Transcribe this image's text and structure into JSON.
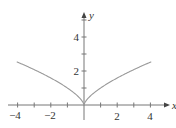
{
  "chart_data": {
    "type": "line",
    "title": "",
    "xlabel": "x",
    "ylabel": "y",
    "function": "y = |x|^(2/3)",
    "xlim": [
      -4.2,
      4.2
    ],
    "ylim": [
      0,
      5.5
    ],
    "x_ticks": [
      -4,
      -3,
      -2,
      -1,
      1,
      2,
      3,
      4
    ],
    "x_tick_labels": [
      "-4",
      "-2",
      "2",
      "4"
    ],
    "y_ticks": [
      1,
      2,
      3,
      4,
      5
    ],
    "y_tick_labels": [
      "2",
      "4"
    ],
    "grid": false,
    "legend": null,
    "series": [
      {
        "name": "y = |x|^(2/3)",
        "x": [
          -4,
          -3,
          -2,
          -1,
          -0.5,
          0,
          0.5,
          1,
          2,
          3,
          4
        ],
        "y": [
          2.52,
          2.08,
          1.59,
          1.0,
          0.63,
          0,
          0.63,
          1.0,
          1.59,
          2.08,
          2.52
        ],
        "color": "#9a9a9a"
      }
    ]
  },
  "labels": {
    "x_axis": "x",
    "y_axis": "y",
    "xt_m4": "−4",
    "xt_m2": "−2",
    "xt_2": "2",
    "xt_4": "4",
    "yt_2": "2",
    "yt_4": "4"
  }
}
